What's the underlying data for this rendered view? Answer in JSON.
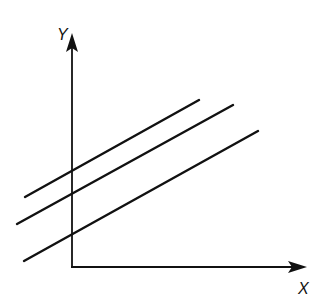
{
  "diagram": {
    "axes": {
      "x_label": "X",
      "y_label": "Y",
      "origin": [
        72,
        267
      ],
      "x_end": [
        306,
        267
      ],
      "y_end": [
        72,
        34
      ]
    },
    "lines": [
      {
        "x1": 25,
        "y1": 197,
        "x2": 199,
        "y2": 100
      },
      {
        "x1": 17,
        "y1": 224,
        "x2": 233,
        "y2": 105
      },
      {
        "x1": 24,
        "y1": 261,
        "x2": 258,
        "y2": 131
      }
    ],
    "stroke_color": "#111111"
  }
}
